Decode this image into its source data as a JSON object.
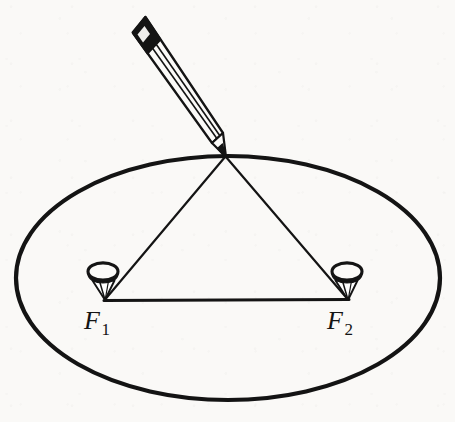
{
  "figure": {
    "caption": "",
    "background_color": "#faf9f7",
    "ink_color": "#141414"
  },
  "labels": {
    "focus_1": {
      "base": "F",
      "subscript": "1",
      "name": "focus-one",
      "x": 84,
      "y": 306
    },
    "focus_2": {
      "base": "F",
      "subscript": "2",
      "name": "focus-two",
      "x": 327,
      "y": 306
    }
  },
  "geometry": {
    "ellipse": {
      "center_x": 228,
      "center_y": 278,
      "radius_x": 212,
      "radius_y": 122,
      "stroke_width": 4.2,
      "color": "#141414"
    },
    "focus_points": [
      {
        "id": "F1",
        "x": 105,
        "y": 300
      },
      {
        "id": "F2",
        "x": 348,
        "y": 300
      }
    ],
    "pencil_tip": {
      "x": 225,
      "y": 156
    },
    "string_segments": [
      {
        "from": "pencil_tip",
        "to": "F1"
      },
      {
        "from": "pencil_tip",
        "to": "F2"
      },
      {
        "from": "F1",
        "to": "F2"
      }
    ],
    "baseline_stroke_width": 3.0,
    "string_stroke_width": 2.1
  },
  "thumbtacks": [
    {
      "id": "tack-1",
      "head_cx": 103,
      "head_cy": 276,
      "head_rx": 15,
      "head_ry": 8.5,
      "pin_tip_x": 105,
      "pin_tip_y": 300
    },
    {
      "id": "tack-2",
      "head_cx": 347,
      "head_cy": 276,
      "head_rx": 15,
      "head_ry": 8.5,
      "pin_tip_x": 348,
      "pin_tip_y": 300
    }
  ],
  "pencil": {
    "tip_x": 225,
    "tip_y": 156,
    "top_left_x": 132,
    "top_left_y": 26,
    "eraser_band_color": "#141414",
    "body_fill": "#fbfaf8",
    "outline_color": "#141414"
  }
}
